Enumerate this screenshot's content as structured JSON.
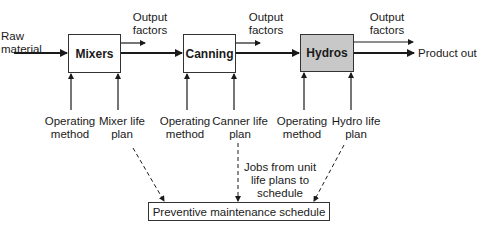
{
  "diagram": {
    "input_label": "Raw material",
    "output_label": "Product out",
    "units": [
      {
        "name": "Mixers",
        "shaded": false,
        "output_factors": "Output factors",
        "operating_method": "Operating method",
        "life_plan": "Mixer life plan"
      },
      {
        "name": "Canning",
        "shaded": false,
        "output_factors": "Output factors",
        "operating_method": "Operating method",
        "life_plan": "Canner life plan"
      },
      {
        "name": "Hydros",
        "shaded": true,
        "output_factors": "Output factors",
        "operating_method": "Operating method",
        "life_plan": "Hydro life plan"
      }
    ],
    "jobs_note": "Jobs from unit life plans to schedule",
    "schedule_label": "Preventive maintenance schedule",
    "colors": {
      "line": "#1a1a1a",
      "shaded_box": "#c8c8c8"
    }
  }
}
